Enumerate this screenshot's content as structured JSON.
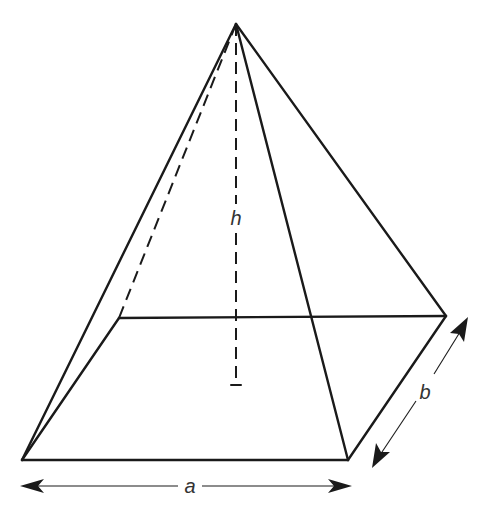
{
  "diagram": {
    "labels": {
      "height": "h",
      "base_length": "a",
      "base_width": "b"
    },
    "colors": {
      "line": "#1a1a1a",
      "label": "#333333",
      "background": "#ffffff"
    },
    "vertices": {
      "apex": [
        236,
        24
      ],
      "front_left": [
        22,
        460
      ],
      "front_right": [
        348,
        460
      ],
      "back_right": [
        446,
        316
      ],
      "back_left": [
        119,
        318
      ],
      "height_foot": [
        236,
        385
      ]
    },
    "edges_visible": [
      "apex-front_left",
      "apex-front_right",
      "apex-back_right",
      "front_left-front_right",
      "front_right-back_right",
      "back_right-back_left",
      "back_left-front_left"
    ],
    "edges_hidden": [
      "apex-back_left",
      "apex-height_foot"
    ],
    "dimensions": [
      {
        "label": "a",
        "from": [
          22,
          486
        ],
        "to": [
          350,
          486
        ]
      },
      {
        "label": "b",
        "from": [
          372,
          467
        ],
        "to": [
          468,
          318
        ]
      }
    ]
  }
}
